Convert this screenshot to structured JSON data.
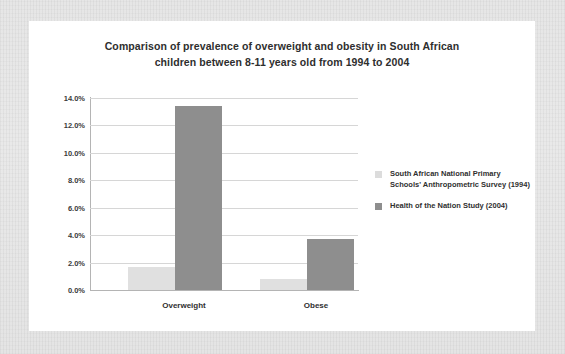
{
  "chart_data": {
    "type": "bar",
    "title": "Comparison of prevalence of overweight and obesity in South African children between 8-11 years old from 1994 to 2004",
    "title_line1": "Comparison of prevalence of overweight and obesity in South African",
    "title_line2": "children between 8-11 years old from 1994 to 2004",
    "categories": [
      "Overweight",
      "Obese"
    ],
    "series": [
      {
        "name": "South African National Primary Schools' Anthropometric Survey (1994)",
        "name_line1": "South African National Primary",
        "name_line2": "Schools' Anthropometric Survey (1994)",
        "color": "#e0e0e0",
        "values": [
          1.7,
          0.8
        ]
      },
      {
        "name": "Health of the Nation Study (2004)",
        "name_line1": "Health of the Nation Study (2004)",
        "name_line2": "",
        "color": "#8e8e8e",
        "values": [
          13.4,
          3.7
        ]
      }
    ],
    "xlabel": "",
    "ylabel": "",
    "ylim": [
      0,
      14
    ],
    "ytick_values": [
      0,
      2,
      4,
      6,
      8,
      10,
      12,
      14
    ],
    "ytick_labels": [
      "0.0%",
      "2.0%",
      "4.0%",
      "6.0%",
      "8.0%",
      "10.0%",
      "12.0%",
      "14.0%"
    ],
    "grid": true,
    "legend_position": "right"
  },
  "axis": {
    "ticks": [
      {
        "label": "14.0%",
        "value": 14
      },
      {
        "label": "12.0%",
        "value": 12
      },
      {
        "label": "10.0%",
        "value": 10
      },
      {
        "label": "8.0%",
        "value": 8
      },
      {
        "label": "6.0%",
        "value": 6
      },
      {
        "label": "4.0%",
        "value": 4
      },
      {
        "label": "2.0%",
        "value": 2
      },
      {
        "label": "0.0%",
        "value": 0
      }
    ]
  }
}
